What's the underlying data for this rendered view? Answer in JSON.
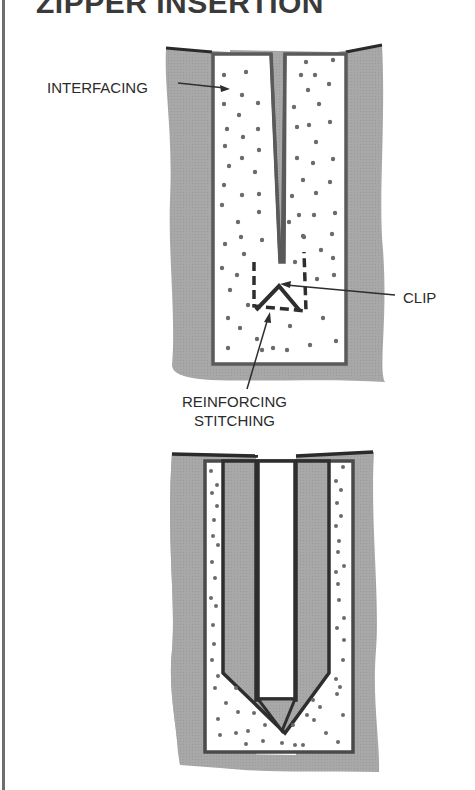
{
  "title": "ZIPPER INSERTION",
  "labels": {
    "interfacing": "INTERFACING",
    "clip": "CLIP",
    "reinforcing_line1": "REINFORCING",
    "reinforcing_line2": "STITCHING"
  },
  "figures": [
    {
      "name": "slashed-opening-with-interfacing",
      "parts": [
        "fabric",
        "interfacing",
        "slash",
        "clip",
        "reinforcing stitching"
      ]
    },
    {
      "name": "turned-facing-with-zipper-opening",
      "parts": [
        "fabric",
        "interfacing strips",
        "facing",
        "triangle at base"
      ]
    }
  ],
  "colors": {
    "fabric": "#a9a9a9",
    "outline": "#4a4a4a",
    "interfacing_fill": "#ffffff",
    "dot": "#6a6a6a",
    "text": "#2b2b2b"
  }
}
